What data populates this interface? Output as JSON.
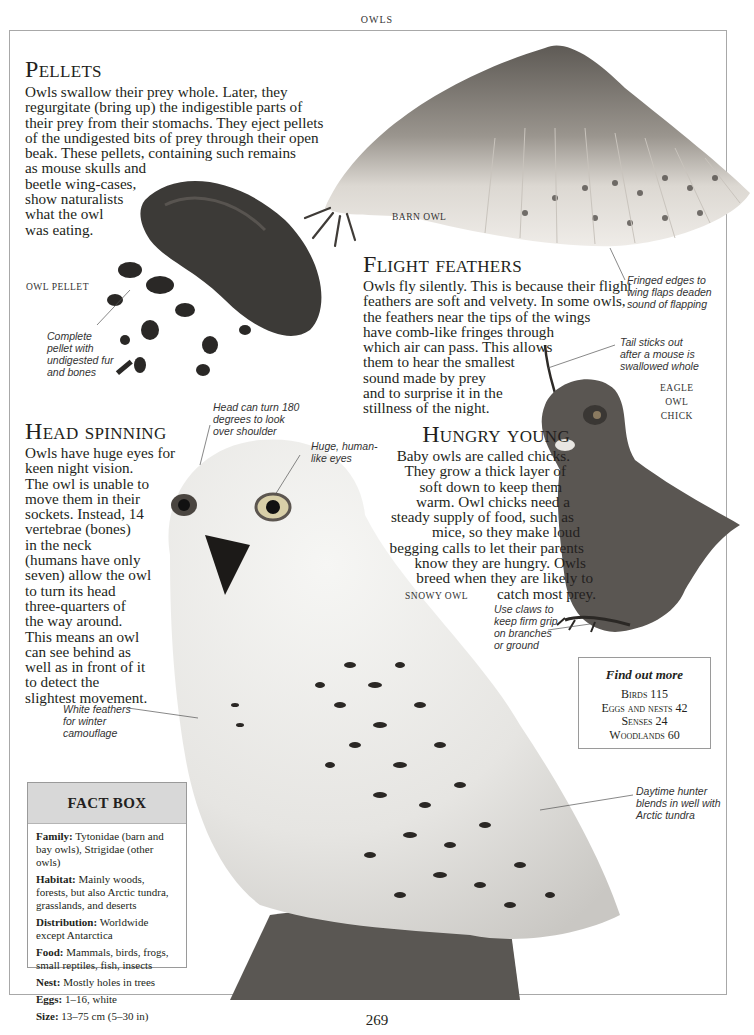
{
  "running_head": "OWLS",
  "page_number": "269",
  "sections": {
    "pellets": {
      "heading": "Pellets",
      "body": "Owls swallow their prey whole. Later, they\nregurgitate (bring up) the indigestible parts of\ntheir prey from their stomachs. They eject pellets\nof the undigested bits of prey through their open\nbeak. These pellets, containing such remains\nas mouse skulls and\nbeetle wing-cases,\nshow naturalists\nwhat the owl\nwas eating."
    },
    "flight_feathers": {
      "heading": "Flight feathers",
      "body": "Owls fly silently. This is because their flight\nfeathers are soft and velvety. In some owls,\nthe feathers  near the tips of the wings\nhave comb-like fringes through\nwhich air can pass. This allows\nthem to hear the smallest\nsound made by prey\nand to surprise it in the\nstillness of the night."
    },
    "head_spinning": {
      "heading": "Head spinning",
      "body": "Owls have huge eyes for\nkeen night vision.\nThe owl is unable to\nmove them in their\nsockets. Instead, 14\nvertebrae (bones)\nin the neck\n(humans have only\nseven) allow the owl\nto turn its head\nthree-quarters of\nthe way around.\nThis means an owl\ncan see behind as\nwell as in front of it\nto detect the\nslightest movement."
    },
    "hungry_young": {
      "heading": "Hungry young",
      "lines": [
        "Baby owls are called chicks.",
        "They grow a thick layer of",
        "soft down to keep them",
        "warm. Owl chicks need a",
        "steady supply of food, such as",
        "mice, so they make loud",
        "begging calls to let their parents",
        "know they are hungry. Owls",
        "breed when they are likely to",
        "catch most prey."
      ]
    }
  },
  "captions": {
    "owl_pellet": "OWL PELLET",
    "barn_owl": "BARN OWL",
    "eagle_owl_chick": "EAGLE\nOWL\nCHICK",
    "snowy_owl": "SNOWY OWL"
  },
  "annotations": {
    "pellet": "Complete\npellet with\nundigested fur\nand bones",
    "fringed_edges": "Fringed edges to\nwing flaps deaden\nsound of flapping",
    "tail": "Tail sticks out\nafter a mouse is\nswallowed whole",
    "head_turn": "Head can turn 180\ndegrees to look\nover shoulder",
    "eyes": "Huge, human-\nlike eyes",
    "claws": "Use claws to\nkeep firm grip\non branches\nor ground",
    "white_feathers": "White feathers\nfor winter\ncamouflage",
    "daytime_hunter": "Daytime hunter\nblends in well with\nArctic tundra"
  },
  "find_out_more": {
    "title": "Find out more",
    "items": [
      {
        "label": "Birds",
        "page": "115"
      },
      {
        "label": "Eggs and nests",
        "page": "42"
      },
      {
        "label": "Senses",
        "page": "24"
      },
      {
        "label": "Woodlands",
        "page": "60"
      }
    ]
  },
  "fact_box": {
    "title": "FACT BOX",
    "rows": [
      {
        "key": "Family:",
        "value": "Tytonidae (barn and bay owls), Strigidae (other owls)"
      },
      {
        "key": "Habitat:",
        "value": "Mainly woods, forests, but also Arctic tundra, grasslands, and deserts"
      },
      {
        "key": "Distribution:",
        "value": "Worldwide except Antarctica"
      },
      {
        "key": "Food:",
        "value": "Mammals, birds, frogs, small reptiles, fish, insects"
      },
      {
        "key": "Nest:",
        "value": "Mostly holes in trees"
      },
      {
        "key": "Eggs:",
        "value": "1–16, white"
      },
      {
        "key": "Size:",
        "value": "13–75 cm (5–30 in)"
      }
    ]
  },
  "colors": {
    "text": "#231f20",
    "frame": "#a8a8a8",
    "factbox_header": "#d8d8d8"
  }
}
